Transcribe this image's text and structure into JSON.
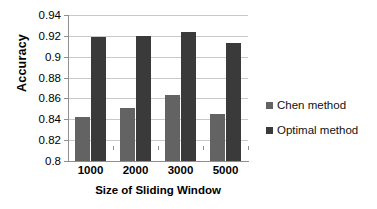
{
  "chart_data": {
    "type": "bar",
    "title": "",
    "xlabel": "Size of Sliding Window",
    "ylabel": "Accuracy",
    "categories": [
      "1000",
      "2000",
      "3000",
      "5000"
    ],
    "series": [
      {
        "name": "Chen method",
        "color": "#636363",
        "values": [
          0.842,
          0.8505,
          0.863,
          0.845
        ]
      },
      {
        "name": "Optimal method",
        "color": "#3a3a3a",
        "values": [
          0.9185,
          0.92,
          0.924,
          0.9128
        ]
      }
    ],
    "ylim": [
      0.8,
      0.94
    ],
    "yticks": [
      "0.94",
      "0.92",
      "0.9",
      "0.88",
      "0.86",
      "0.84",
      "0.82",
      "0.8"
    ],
    "ytick_values": [
      0.94,
      0.92,
      0.9,
      0.88,
      0.86,
      0.84,
      0.82,
      0.8
    ],
    "grid": true,
    "legend_position": "right"
  },
  "legend": {
    "items": [
      {
        "label": "Chen method",
        "marker": "square-marker"
      },
      {
        "label": "Optimal method",
        "marker": "square-marker"
      }
    ]
  }
}
